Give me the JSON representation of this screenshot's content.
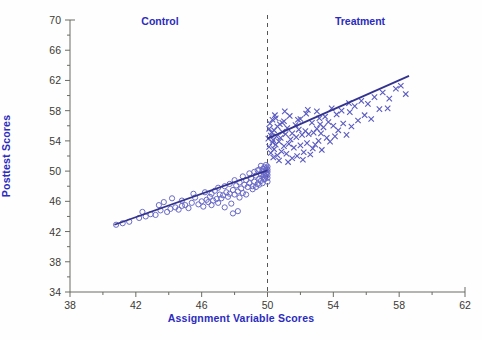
{
  "chart_data": {
    "type": "scatter",
    "title": "",
    "xlabel": "Assignment Variable Scores",
    "ylabel": "Posttest Scores",
    "xlim": [
      38,
      62
    ],
    "ylim": [
      34,
      70
    ],
    "xticks": [
      38,
      42,
      46,
      50,
      54,
      58,
      62
    ],
    "yticks": [
      34,
      38,
      42,
      46,
      50,
      54,
      58,
      62,
      66,
      70
    ],
    "xtick_step": 4,
    "ytick_step": 4,
    "minor_ticks": true,
    "grid": false,
    "legend_position": "none",
    "cutoff": {
      "x": 50,
      "style": "dashed",
      "color": "#555555",
      "label_left": "Control",
      "label_right": "Treatment"
    },
    "annotations": [
      {
        "text": "Control",
        "x": 45,
        "y": 70.5,
        "color": "#2b2bbf"
      },
      {
        "text": "Treatment",
        "x": 55.5,
        "y": 70.5,
        "color": "#2b2bbf"
      }
    ],
    "series": [
      {
        "name": "Control",
        "marker": "open-circle",
        "color": "#6a6ac8",
        "fit_line": {
          "color": "#33338f",
          "x": [
            40.7,
            50.0
          ],
          "y": [
            42.9,
            50.1
          ]
        },
        "points": [
          [
            40.8,
            42.9
          ],
          [
            41.6,
            43.3
          ],
          [
            42.2,
            43.8
          ],
          [
            42.6,
            44.0
          ],
          [
            42.9,
            44.3
          ],
          [
            43.2,
            44.2
          ],
          [
            43.5,
            44.8
          ],
          [
            43.7,
            45.9
          ],
          [
            43.9,
            44.6
          ],
          [
            44.1,
            45.0
          ],
          [
            44.4,
            45.2
          ],
          [
            44.6,
            44.9
          ],
          [
            44.8,
            45.4
          ],
          [
            45.0,
            45.5
          ],
          [
            45.2,
            45.1
          ],
          [
            45.4,
            45.8
          ],
          [
            45.6,
            46.5
          ],
          [
            45.8,
            45.6
          ],
          [
            46.0,
            46.0
          ],
          [
            46.1,
            45.3
          ],
          [
            46.3,
            46.2
          ],
          [
            46.4,
            45.9
          ],
          [
            46.5,
            46.6
          ],
          [
            46.6,
            45.5
          ],
          [
            46.7,
            46.1
          ],
          [
            46.8,
            47.4
          ],
          [
            46.9,
            46.3
          ],
          [
            47.0,
            45.8
          ],
          [
            47.1,
            46.9
          ],
          [
            47.2,
            46.4
          ],
          [
            47.3,
            46.8
          ],
          [
            47.4,
            45.2
          ],
          [
            47.5,
            47.2
          ],
          [
            47.6,
            46.6
          ],
          [
            47.7,
            47.0
          ],
          [
            47.8,
            45.7
          ],
          [
            47.9,
            47.5
          ],
          [
            48.0,
            46.9
          ],
          [
            48.1,
            48.1
          ],
          [
            48.2,
            47.3
          ],
          [
            48.3,
            48.5
          ],
          [
            48.4,
            47.7
          ],
          [
            48.5,
            47.1
          ],
          [
            48.6,
            48.2
          ],
          [
            48.7,
            48.8
          ],
          [
            48.8,
            47.9
          ],
          [
            48.9,
            48.4
          ],
          [
            49.0,
            49.1
          ],
          [
            49.1,
            48.0
          ],
          [
            49.2,
            48.6
          ],
          [
            49.3,
            49.4
          ],
          [
            49.4,
            48.3
          ],
          [
            49.5,
            49.0
          ],
          [
            49.5,
            50.2
          ],
          [
            49.6,
            49.6
          ],
          [
            49.6,
            48.7
          ],
          [
            49.7,
            50.0
          ],
          [
            49.7,
            49.2
          ],
          [
            49.8,
            50.5
          ],
          [
            49.8,
            49.5
          ],
          [
            49.8,
            48.9
          ],
          [
            49.9,
            50.1
          ],
          [
            49.9,
            49.8
          ],
          [
            49.9,
            49.3
          ],
          [
            50.0,
            50.6
          ],
          [
            50.0,
            50.2
          ],
          [
            50.0,
            49.9
          ],
          [
            50.0,
            49.5
          ],
          [
            50.0,
            49.1
          ],
          [
            50.0,
            48.6
          ],
          [
            49.95,
            50.4
          ],
          [
            49.95,
            49.7
          ],
          [
            49.9,
            50.8
          ],
          [
            49.85,
            49.0
          ],
          [
            49.75,
            50.3
          ],
          [
            49.7,
            48.4
          ],
          [
            49.6,
            50.7
          ],
          [
            49.5,
            48.2
          ],
          [
            49.4,
            50.1
          ],
          [
            49.3,
            47.9
          ],
          [
            49.2,
            49.9
          ],
          [
            49.1,
            47.6
          ],
          [
            48.9,
            49.7
          ],
          [
            48.7,
            46.9
          ],
          [
            48.5,
            49.3
          ],
          [
            48.3,
            46.5
          ],
          [
            48.0,
            48.8
          ],
          [
            47.7,
            48.3
          ],
          [
            47.4,
            48.0
          ],
          [
            47.0,
            47.8
          ],
          [
            46.6,
            47.0
          ],
          [
            46.2,
            47.2
          ],
          [
            45.5,
            47.0
          ],
          [
            44.8,
            46.1
          ],
          [
            44.2,
            46.4
          ],
          [
            43.4,
            45.5
          ],
          [
            42.4,
            44.6
          ],
          [
            41.2,
            43.1
          ],
          [
            47.9,
            44.4
          ],
          [
            48.2,
            44.7
          ]
        ]
      },
      {
        "name": "Treatment",
        "marker": "cross",
        "color": "#5a5ac0",
        "fit_line": {
          "color": "#33338f",
          "x": [
            50.0,
            58.6
          ],
          "y": [
            54.3,
            62.6
          ]
        },
        "points": [
          [
            50.05,
            54.3
          ],
          [
            50.1,
            55.6
          ],
          [
            50.1,
            53.2
          ],
          [
            50.15,
            56.3
          ],
          [
            50.2,
            54.7
          ],
          [
            50.2,
            52.4
          ],
          [
            50.25,
            55.1
          ],
          [
            50.3,
            53.8
          ],
          [
            50.3,
            56.8
          ],
          [
            50.35,
            54.1
          ],
          [
            50.4,
            52.9
          ],
          [
            50.4,
            55.4
          ],
          [
            50.5,
            53.5
          ],
          [
            50.5,
            57.0
          ],
          [
            50.55,
            54.6
          ],
          [
            50.6,
            52.1
          ],
          [
            50.6,
            55.9
          ],
          [
            50.7,
            53.9
          ],
          [
            50.75,
            56.2
          ],
          [
            50.8,
            54.4
          ],
          [
            50.85,
            52.6
          ],
          [
            50.9,
            55.2
          ],
          [
            51.0,
            53.3
          ],
          [
            51.0,
            56.6
          ],
          [
            51.1,
            54.9
          ],
          [
            51.15,
            52.3
          ],
          [
            51.2,
            55.7
          ],
          [
            51.3,
            53.6
          ],
          [
            51.35,
            57.3
          ],
          [
            51.4,
            54.2
          ],
          [
            51.5,
            51.7
          ],
          [
            51.5,
            55.0
          ],
          [
            51.6,
            53.1
          ],
          [
            51.7,
            56.1
          ],
          [
            51.75,
            54.5
          ],
          [
            51.8,
            52.0
          ],
          [
            51.9,
            55.5
          ],
          [
            52.0,
            53.4
          ],
          [
            52.0,
            56.9
          ],
          [
            52.1,
            54.8
          ],
          [
            52.2,
            52.5
          ],
          [
            52.3,
            55.3
          ],
          [
            52.35,
            57.6
          ],
          [
            52.4,
            53.7
          ],
          [
            52.5,
            54.9
          ],
          [
            52.6,
            52.2
          ],
          [
            52.7,
            56.4
          ],
          [
            52.8,
            55.1
          ],
          [
            52.9,
            53.5
          ],
          [
            53.0,
            57.9
          ],
          [
            53.0,
            55.6
          ],
          [
            53.1,
            54.0
          ],
          [
            53.2,
            56.2
          ],
          [
            53.3,
            52.8
          ],
          [
            53.4,
            55.8
          ],
          [
            53.5,
            57.2
          ],
          [
            53.6,
            54.4
          ],
          [
            53.7,
            56.5
          ],
          [
            53.8,
            53.9
          ],
          [
            53.9,
            58.3
          ],
          [
            54.0,
            56.0
          ],
          [
            54.1,
            54.6
          ],
          [
            54.2,
            57.5
          ],
          [
            54.3,
            55.4
          ],
          [
            54.5,
            58.0
          ],
          [
            54.6,
            56.3
          ],
          [
            54.8,
            54.8
          ],
          [
            55.0,
            57.8
          ],
          [
            55.1,
            55.9
          ],
          [
            55.3,
            58.6
          ],
          [
            55.5,
            56.7
          ],
          [
            55.7,
            59.3
          ],
          [
            55.9,
            57.4
          ],
          [
            56.1,
            58.9
          ],
          [
            56.3,
            56.9
          ],
          [
            56.5,
            59.8
          ],
          [
            56.8,
            58.2
          ],
          [
            57.0,
            60.4
          ],
          [
            57.3,
            58.3
          ],
          [
            57.4,
            59.6
          ],
          [
            57.8,
            60.9
          ],
          [
            58.1,
            61.3
          ],
          [
            58.4,
            60.2
          ],
          [
            52.45,
            58.1
          ],
          [
            51.05,
            57.9
          ],
          [
            50.45,
            57.4
          ],
          [
            53.15,
            57.0
          ],
          [
            54.95,
            59.0
          ],
          [
            50.7,
            51.4
          ],
          [
            51.25,
            51.2
          ],
          [
            52.15,
            51.5
          ],
          [
            53.25,
            55.0
          ],
          [
            51.85,
            56.8
          ],
          [
            50.9,
            56.4
          ],
          [
            52.75,
            53.0
          ],
          [
            50.35,
            51.8
          ]
        ]
      }
    ]
  }
}
